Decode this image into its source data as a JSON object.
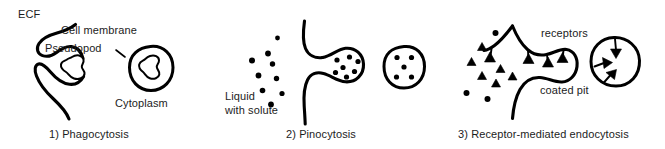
{
  "figure": {
    "background_color": "#ffffff",
    "stroke_color": "#000000",
    "text_color": "#1c1c1c",
    "width": 665,
    "height": 149
  },
  "panels": [
    {
      "id": "phagocytosis",
      "number": "1)",
      "caption": "1) Phagocytosis",
      "labels": {
        "ecf": "ECF",
        "cell_membrane": "Cell membrane",
        "pseudopod": "Pseudopod",
        "cytoplasm": "Cytoplasm"
      },
      "elements": [
        "engulfing-membrane",
        "particle",
        "phagosome-vesicle",
        "phagosome-particle"
      ]
    },
    {
      "id": "pinocytosis",
      "number": "2)",
      "caption": "2) Pinocytosis",
      "labels": {
        "liquid_with_solute_line1": "Liquid",
        "liquid_with_solute_line2": "with solute",
        "liquid_with_solute": "Liquid with solute"
      },
      "elements": [
        "cell-membrane-invagination",
        "extracellular-solute-dots",
        "pinocytic-pocket",
        "pinocytic-vesicle"
      ],
      "extracellular_solute_dot_count": 9,
      "pocket_solute_dot_count": 7,
      "vesicle_solute_dot_count": 5
    },
    {
      "id": "receptor-mediated-endocytosis",
      "number": "3)",
      "caption": "3) Receptor-mediated endocytosis",
      "labels": {
        "receptors": "receptors",
        "coated_pit": "coated pit"
      },
      "elements": [
        "cell-membrane-with-receptors",
        "free-ligand-particles",
        "coated-pit",
        "coated-vesicle"
      ],
      "free_ligand_count": 9,
      "membrane_receptor_count": 4,
      "vesicle_receptor_count": 3
    }
  ]
}
